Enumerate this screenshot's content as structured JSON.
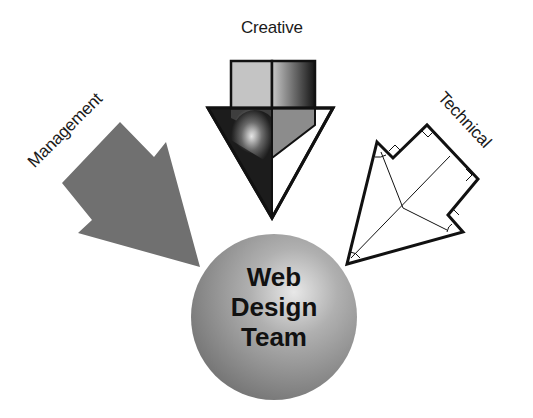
{
  "diagram": {
    "title": "Web Design Team",
    "center": {
      "lines": [
        "Web",
        "Design",
        "Team"
      ],
      "shape": "sphere",
      "color": "#9a9a9a"
    },
    "inputs": [
      {
        "label": "Management",
        "shape": "solid-arrow",
        "color": "#707070"
      },
      {
        "label": "Creative",
        "shape": "gradient-arrow",
        "color": "#3a3a3a"
      },
      {
        "label": "Technical",
        "shape": "outline-arrow-with-geometry",
        "color": "#111111"
      }
    ]
  }
}
